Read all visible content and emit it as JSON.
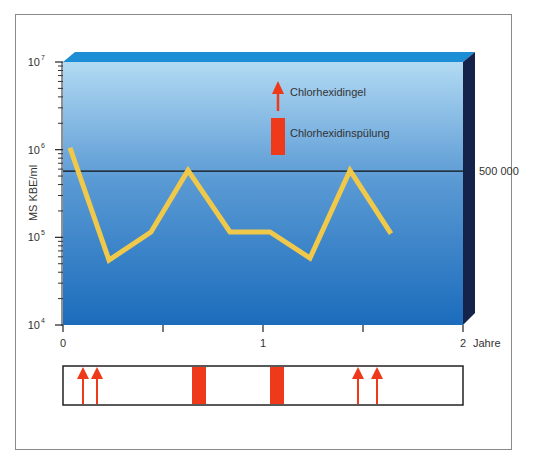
{
  "chart_data": {
    "type": "line",
    "title": "",
    "xlabel": "Jahre",
    "ylabel": "MS  KBE/ml",
    "yscale": "log",
    "ylim": [
      10000,
      10000000
    ],
    "xlim": [
      0,
      2
    ],
    "x_ticks": [
      {
        "value": 0,
        "label": "0"
      },
      {
        "value": 0.5,
        "label": ""
      },
      {
        "value": 1,
        "label": "1"
      },
      {
        "value": 1.5,
        "label": ""
      },
      {
        "value": 2,
        "label": "2"
      }
    ],
    "y_ticks": [
      {
        "value": 10000,
        "base": "10",
        "exp": "4"
      },
      {
        "value": 100000,
        "base": "10",
        "exp": "5"
      },
      {
        "value": 1000000,
        "base": "10",
        "exp": "6"
      },
      {
        "value": 10000000,
        "base": "10",
        "exp": "7"
      }
    ],
    "grid": false,
    "series": [
      {
        "name": "MS KBE/ml",
        "color": "#f0c84a",
        "x": [
          0.035,
          0.23,
          0.44,
          0.625,
          0.835,
          1.035,
          1.235,
          1.435,
          1.64
        ],
        "values": [
          1050000,
          55000,
          115000,
          580000,
          115000,
          115000,
          58000,
          580000,
          110000
        ]
      }
    ],
    "reference_line": {
      "value": 500000,
      "label": "500 000",
      "color": "#111111"
    },
    "legend": {
      "position": "top-right-inside",
      "entries": [
        {
          "symbol": "arrow",
          "label": "Chlorhexidingel",
          "color": "#ee3a1a"
        },
        {
          "symbol": "bar",
          "label": "Chlorhexidinspülung",
          "color": "#ee3a1a"
        }
      ]
    },
    "treatments": {
      "gel_arrows": [
        0.1,
        0.17,
        1.475,
        1.57
      ],
      "rinse_periods": [
        [
          0.645,
          0.715
        ],
        [
          1.035,
          1.105
        ]
      ]
    },
    "colors": {
      "plot_top": "#b2daf3",
      "plot_mid": "#5a9ad4",
      "plot_bottom": "#1b6cbc",
      "top_face": "#1b8ed6",
      "side_face": "#15224a",
      "marker": "#ee3a1a"
    }
  }
}
